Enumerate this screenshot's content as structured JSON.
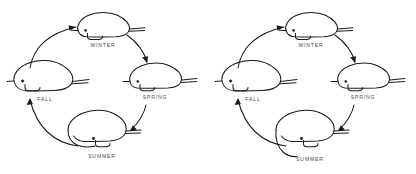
{
  "figure": {
    "type": "seasonal-life-cycle-diagram",
    "panel_count": 2,
    "background_color": "#ffffff",
    "ink_color": "#1a1a1a",
    "label_color": "#4a4a4a"
  },
  "panels": [
    {
      "id": "left",
      "stages": [
        {
          "key": "winter",
          "label": "WINTER",
          "position": "top",
          "form": "compact-rounded"
        },
        {
          "key": "spring",
          "label": "SPRING",
          "position": "right",
          "form": "tapered-snout"
        },
        {
          "key": "summer",
          "label": "SUMMER",
          "position": "bottom",
          "form": "elongated-curved-belly"
        },
        {
          "key": "fall",
          "label": "FALL",
          "position": "left",
          "form": "broad-full-bodied"
        }
      ],
      "arrows": [
        {
          "from": "fall",
          "to": "winter",
          "direction": "up-right"
        },
        {
          "from": "winter",
          "to": "spring",
          "direction": "down-right"
        },
        {
          "from": "spring",
          "to": "summer",
          "direction": "down-left"
        },
        {
          "from": "summer",
          "to": "fall",
          "direction": "up-left"
        }
      ]
    },
    {
      "id": "right",
      "stages": [
        {
          "key": "winter",
          "label": "WINTER",
          "position": "top",
          "form": "compact-rounded"
        },
        {
          "key": "spring",
          "label": "SPRING",
          "position": "right",
          "form": "tapered-snout"
        },
        {
          "key": "summer",
          "label": "SUMMER",
          "position": "bottom",
          "form": "elongated-curved-belly"
        },
        {
          "key": "fall",
          "label": "FALL",
          "position": "left",
          "form": "broad-full-bodied"
        }
      ],
      "arrows": [
        {
          "from": "fall",
          "to": "winter",
          "direction": "up-right"
        },
        {
          "from": "winter",
          "to": "spring",
          "direction": "down-right"
        },
        {
          "from": "spring",
          "to": "summer",
          "direction": "down-left"
        },
        {
          "from": "summer",
          "to": "fall",
          "direction": "up-left"
        }
      ]
    }
  ]
}
